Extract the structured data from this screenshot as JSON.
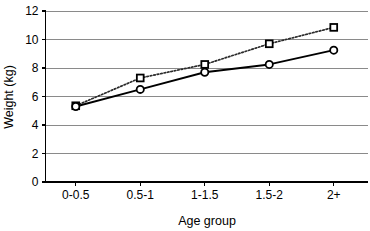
{
  "chart_data": {
    "type": "line",
    "title": "",
    "xlabel": "Age group",
    "ylabel": "Weight (kg)",
    "categories": [
      "0-0.5",
      "0.5-1",
      "1-1.5",
      "1.5-2",
      "2+"
    ],
    "yticks": [
      "0",
      "2",
      "4",
      "6",
      "8",
      "10",
      "12"
    ],
    "ytick_values": [
      0,
      2,
      4,
      6,
      8,
      10,
      12
    ],
    "ylim": [
      0,
      12
    ],
    "grid": "horizontal",
    "legend": "none",
    "series": [
      {
        "name": "dotted-square-series",
        "marker": "open-square",
        "linestyle": "dotted",
        "color": "#000000",
        "values": [
          5.35,
          7.3,
          8.25,
          9.7,
          10.85
        ]
      },
      {
        "name": "solid-circle-series",
        "marker": "open-circle",
        "linestyle": "solid",
        "color": "#000000",
        "values": [
          5.3,
          6.5,
          7.7,
          8.25,
          9.25
        ]
      }
    ]
  }
}
